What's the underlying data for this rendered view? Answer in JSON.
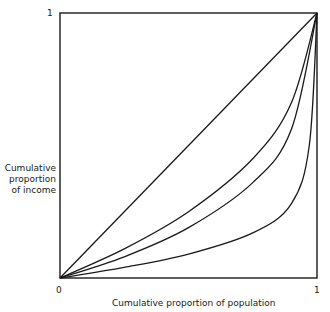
{
  "chart_data": {
    "type": "line",
    "title": "",
    "xlabel": "Cumulative proportion of population",
    "ylabel": "Cumulative proportion of income",
    "ylabel_lines": [
      "Cumulative",
      "proportion",
      "of income"
    ],
    "xlim": [
      0,
      1
    ],
    "ylim": [
      0,
      1
    ],
    "x_ticks": [
      "0",
      "1"
    ],
    "y_ticks": [
      "1"
    ],
    "grid": false,
    "legend": null,
    "series": [
      {
        "name": "line of equality",
        "x": [
          0,
          0.25,
          0.5,
          0.75,
          1
        ],
        "values": [
          0,
          0.25,
          0.5,
          0.75,
          1
        ]
      },
      {
        "name": "Lorenz curve A",
        "x": [
          0,
          0.25,
          0.5,
          0.75,
          0.9,
          1
        ],
        "values": [
          0,
          0.11,
          0.25,
          0.45,
          0.66,
          1
        ]
      },
      {
        "name": "Lorenz curve B",
        "x": [
          0,
          0.25,
          0.5,
          0.75,
          0.9,
          1
        ],
        "values": [
          0,
          0.08,
          0.19,
          0.36,
          0.56,
          1
        ]
      },
      {
        "name": "Lorenz curve C",
        "x": [
          0,
          0.25,
          0.5,
          0.75,
          0.9,
          0.97,
          1
        ],
        "values": [
          0,
          0.04,
          0.09,
          0.17,
          0.28,
          0.5,
          1
        ]
      }
    ]
  }
}
